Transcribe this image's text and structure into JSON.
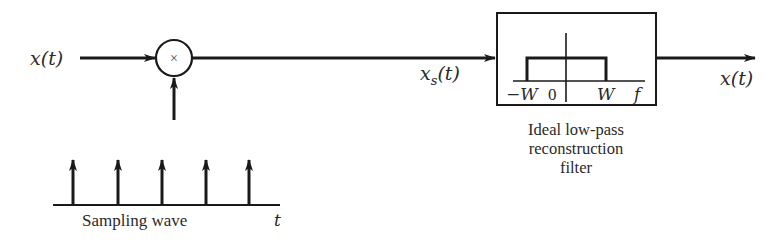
{
  "diagram": {
    "type": "sampling-and-reconstruction block diagram",
    "input_label": "x(t)",
    "multiplier_symbol": "×",
    "sampled_signal_label": "x",
    "sampled_signal_subscript": "s",
    "sampled_signal_suffix": "(t)",
    "output_label": "x(t)",
    "sampling_wave": {
      "label": "Sampling wave",
      "axis_label": "t",
      "impulse_count": 5
    },
    "filter": {
      "caption_line1": "Ideal low-pass",
      "caption_line2": "reconstruction",
      "caption_line3": "filter",
      "tick_neg": "−W",
      "tick_zero": "0",
      "tick_pos": "W",
      "axis_label": "f"
    },
    "colors": {
      "stroke": "#1a1a1a",
      "text": "#2a2a2a",
      "background": "#ffffff"
    }
  }
}
